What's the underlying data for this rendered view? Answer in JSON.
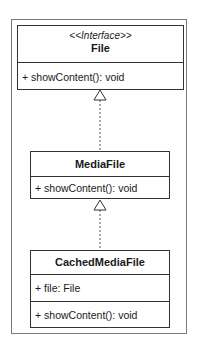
{
  "diagram": {
    "type": "uml-class-diagram",
    "classes": [
      {
        "id": "file",
        "stereotype": "<<Interface>>",
        "name": "File",
        "attributes": [],
        "methods": [
          "+ showContent(): void"
        ]
      },
      {
        "id": "media-file",
        "name": "MediaFile",
        "attributes": [],
        "methods": [
          "+ showContent(): void"
        ]
      },
      {
        "id": "cached-media-file",
        "name": "CachedMediaFile",
        "attributes": [
          "+ file: File"
        ],
        "methods": [
          "+ showContent(): void"
        ]
      }
    ],
    "relations": [
      {
        "from": "media-file",
        "to": "file",
        "kind": "realization",
        "style": "dashed-line-hollow-triangle"
      },
      {
        "from": "cached-media-file",
        "to": "media-file",
        "kind": "realization",
        "style": "dashed-line-hollow-triangle"
      }
    ],
    "colors": {
      "border": "#333333",
      "frame": "#7a7a7a",
      "background": "#ffffff",
      "text": "#1a1a1a"
    }
  }
}
